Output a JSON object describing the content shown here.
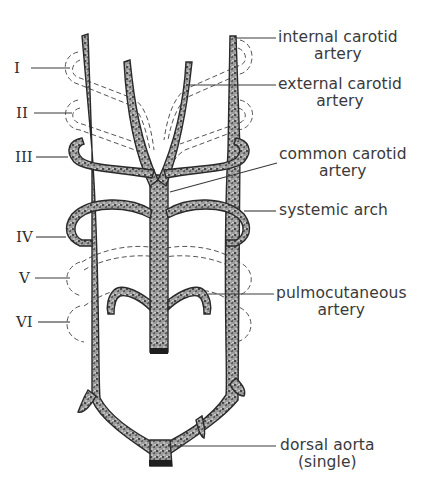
{
  "figure": {
    "arch_numerals": [
      {
        "id": "I",
        "label": "I"
      },
      {
        "id": "II",
        "label": "II"
      },
      {
        "id": "III",
        "label": "III"
      },
      {
        "id": "IV",
        "label": "IV"
      },
      {
        "id": "V",
        "label": "V"
      },
      {
        "id": "VI",
        "label": "VI"
      }
    ],
    "labels": {
      "internal_carotid": {
        "line1": "internal carotid",
        "line2": "artery"
      },
      "external_carotid": {
        "line1": "external carotid",
        "line2": "artery"
      },
      "common_carotid": {
        "line1": "common carotid",
        "line2": "artery"
      },
      "systemic_arch": {
        "line1": "systemic arch"
      },
      "pulmocutaneous": {
        "line1": "pulmocutaneous",
        "line2": "artery"
      },
      "dorsal_aorta": {
        "line1": "dorsal aorta",
        "line2": "(single)"
      }
    },
    "colors": {
      "vessel_stroke": "#2a2a2a",
      "vessel_fill": "#8a8a8a",
      "text": "#3a3a3a",
      "background": "#ffffff"
    }
  }
}
